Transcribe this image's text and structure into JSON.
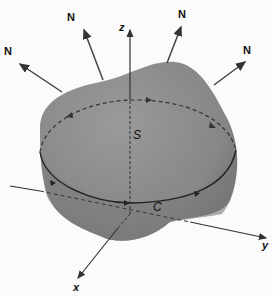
{
  "figure": {
    "labels": {
      "normal": "N",
      "surface": "S",
      "curve": "C",
      "x_axis": "x",
      "y_axis": "y",
      "z_axis": "z"
    },
    "colors": {
      "surface": "#8a8a8a",
      "surface_dark": "#5e5e5e",
      "lines": "#333333"
    },
    "normal_count": 4
  }
}
